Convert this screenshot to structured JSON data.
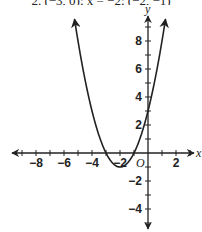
{
  "caption": "2. (−3, 0); x = −2; (−2, −1)",
  "chart_data": {
    "type": "line",
    "title": "",
    "function": "y = x^2 + 4x + 3 = (x + 2)^2 - 1",
    "xlabel": "x",
    "ylabel": "y",
    "origin_label": "O",
    "xlim": [
      -10,
      3.5
    ],
    "ylim": [
      -5.5,
      10
    ],
    "x_ticks": [
      -8,
      -6,
      -4,
      -2,
      2
    ],
    "y_ticks": [
      8,
      6,
      4,
      2,
      -2,
      -4
    ],
    "x_tick_labels": [
      "−8",
      "−6",
      "−4",
      "−2",
      "2"
    ],
    "y_tick_labels": [
      "8",
      "6",
      "4",
      "2",
      "−2",
      "−4"
    ],
    "grid": false,
    "vertex": [
      -2,
      -1
    ],
    "axis_of_symmetry": "x = -2",
    "x_intercepts": [
      -3,
      -1
    ],
    "y_intercept": 3,
    "series": [
      {
        "name": "parabola",
        "x": [
          -5.25,
          -5,
          -4.5,
          -4,
          -3.5,
          -3,
          -2.5,
          -2,
          -1.5,
          -1,
          -0.5,
          0,
          0.5,
          1,
          1.25
        ],
        "values": [
          9.56,
          8,
          5.25,
          3,
          1.25,
          0,
          -0.75,
          -1,
          -0.75,
          0,
          1.25,
          3,
          5.25,
          8,
          9.56
        ]
      }
    ]
  }
}
